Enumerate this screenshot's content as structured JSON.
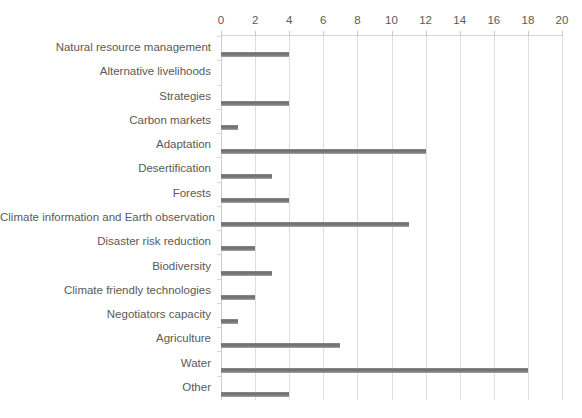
{
  "chart_data": {
    "type": "bar",
    "orientation": "horizontal",
    "title": "",
    "subtitle": "",
    "xlabel": "",
    "ylabel": "",
    "xlim": [
      0,
      20
    ],
    "xticks": [
      0,
      2,
      4,
      6,
      8,
      10,
      12,
      14,
      16,
      18,
      20
    ],
    "xtick_labels": [
      "0",
      "2",
      "4",
      "6",
      "8",
      "10",
      "12",
      "14",
      "16",
      "18",
      "20"
    ],
    "x_axis_position": "top",
    "grid": true,
    "grid_axis": "x",
    "legend": false,
    "legend_position": "none",
    "bar_color": "#7a7a7a",
    "grid_color": "#dedede",
    "text_color": "#5a5a5a",
    "background_color": "#ffffff",
    "categories": [
      "Natural resource management",
      "Alternative livelihoods",
      "Strategies",
      "Carbon markets",
      "Adaptation",
      "Desertification",
      "Forests",
      "Climate information and Earth observation",
      "Disaster risk reduction",
      "Biodiversity",
      "Climate friendly technologies",
      "Negotiators capacity",
      "Agriculture",
      "Water",
      "Other"
    ],
    "values": [
      4,
      0,
      4,
      1,
      12,
      3,
      4,
      11,
      2,
      3,
      2,
      1,
      7,
      18,
      4
    ]
  }
}
